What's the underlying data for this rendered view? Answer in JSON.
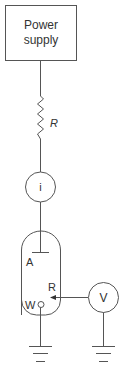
{
  "diagram": {
    "type": "electrochemical-circuit",
    "colors": {
      "stroke": "#555555",
      "text": "#333333",
      "background": "#ffffff"
    },
    "power_supply": {
      "label_line1": "Power",
      "label_line2": "supply"
    },
    "resistor": {
      "label": "R"
    },
    "ammeter": {
      "label": "i"
    },
    "cell": {
      "electrodes": {
        "auxiliary": "A",
        "reference": "R",
        "working": "W"
      }
    },
    "voltmeter": {
      "label": "V"
    },
    "grounds": [
      "ground-working",
      "ground-voltmeter"
    ]
  }
}
